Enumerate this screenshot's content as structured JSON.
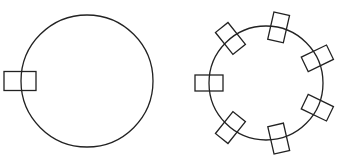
{
  "figure": {
    "stroke_color": "#222222",
    "background": "#ffffff",
    "left_diagram": {
      "description": "circle with one rectangle on its left edge",
      "circle": {
        "cx": 87,
        "cy": 81,
        "r": 66
      },
      "rectangles": [
        {
          "cx": 20,
          "cy": 81,
          "w": 32,
          "h": 19,
          "angle": 0
        }
      ]
    },
    "right_diagram": {
      "description": "circle with seven rectangles evenly spaced around its edge",
      "circle": {
        "cx": 266,
        "cy": 83,
        "r": 57
      },
      "rect_size": {
        "w": 28,
        "h": 16
      },
      "rectangle_angles_deg": [
        180,
        231.4,
        282.8,
        334.3,
        25.7,
        77.1,
        128.6
      ]
    }
  }
}
